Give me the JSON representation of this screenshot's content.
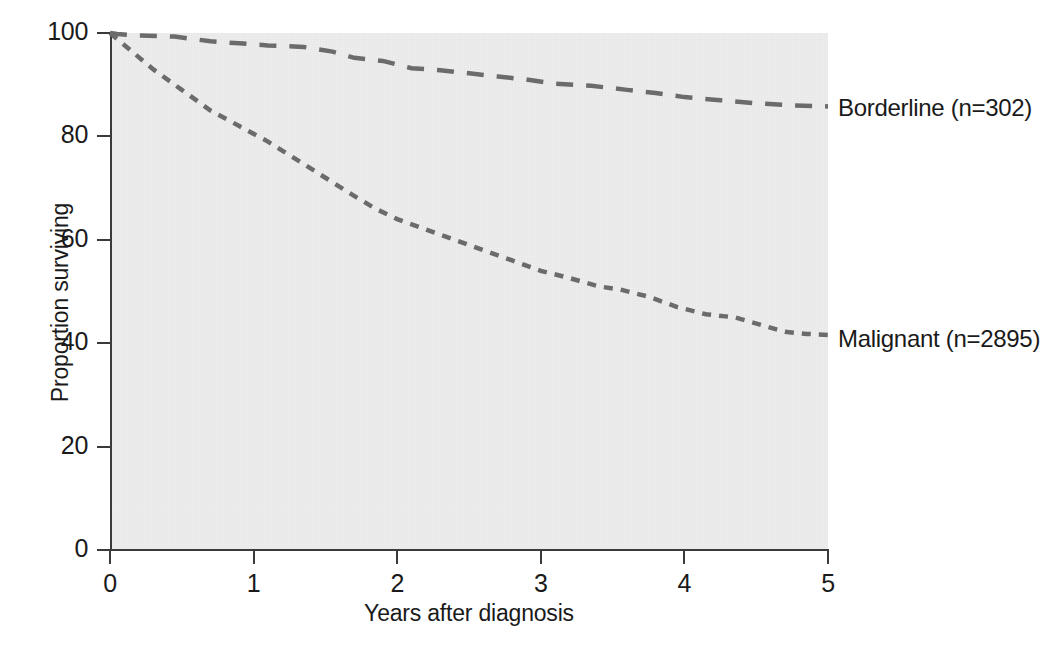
{
  "chart_data": {
    "type": "line",
    "title": "",
    "subtitle": "",
    "xlabel": "Years after diagnosis",
    "ylabel": "Proportion surviving",
    "xlim": [
      0,
      5
    ],
    "ylim": [
      0,
      100
    ],
    "xticks": [
      "0",
      "1",
      "2",
      "3",
      "4",
      "5"
    ],
    "xtick_values": [
      0,
      1,
      2,
      3,
      4,
      5
    ],
    "yticks": [
      "0",
      "20",
      "40",
      "60",
      "80",
      "100"
    ],
    "ytick_values": [
      0,
      20,
      40,
      60,
      80,
      100
    ],
    "grid": false,
    "legend_position": "inline-right",
    "plot_background": "#ededed",
    "line_color": "#5a5a5a",
    "axis_color": "#3a3a3a",
    "series": [
      {
        "name": "Borderline (n=302)",
        "label": "Borderline (n=302)",
        "n": 302,
        "dash": "long-dash",
        "color": "#6b6b6b",
        "x": [
          0.0,
          0.05,
          0.2,
          0.45,
          0.7,
          0.9,
          1.1,
          1.35,
          1.55,
          1.7,
          1.9,
          2.1,
          2.3,
          2.5,
          2.7,
          2.9,
          3.1,
          3.35,
          3.6,
          3.8,
          4.0,
          4.25,
          4.5,
          4.75,
          5.0
        ],
        "y": [
          100.0,
          99.8,
          99.5,
          99.3,
          98.4,
          98.0,
          97.6,
          97.3,
          96.4,
          95.2,
          94.6,
          93.2,
          92.8,
          92.2,
          91.6,
          91.0,
          90.2,
          89.8,
          89.0,
          88.4,
          87.6,
          87.0,
          86.4,
          86.0,
          85.8
        ]
      },
      {
        "name": "Malignant (n=2895)",
        "label": "Malignant (n=2895)",
        "n": 2895,
        "dash": "short-dash",
        "color": "#6b6b6b",
        "x": [
          0.0,
          0.15,
          0.3,
          0.5,
          0.7,
          0.9,
          1.1,
          1.3,
          1.5,
          1.7,
          1.85,
          2.0,
          2.2,
          2.4,
          2.6,
          2.8,
          3.0,
          3.2,
          3.4,
          3.55,
          3.75,
          3.95,
          4.15,
          4.35,
          4.55,
          4.7,
          4.85,
          5.0
        ],
        "y": [
          100.0,
          96.5,
          93.0,
          89.0,
          85.0,
          82.0,
          79.0,
          75.5,
          72.0,
          68.5,
          66.0,
          64.0,
          62.0,
          60.0,
          58.0,
          56.0,
          54.0,
          52.6,
          51.0,
          50.4,
          49.0,
          47.0,
          45.6,
          45.0,
          43.4,
          42.2,
          41.8,
          41.6
        ]
      }
    ]
  },
  "labels": {
    "borderline": "Borderline (n=302)",
    "malignant": "Malignant (n=2895)"
  }
}
